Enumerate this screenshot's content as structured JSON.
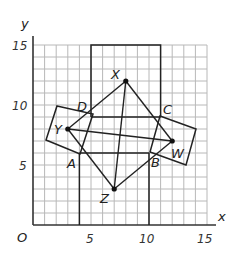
{
  "diagram": {
    "axes": {
      "x_label": "x",
      "y_label": "y",
      "origin_label": "O",
      "x_ticks": [
        {
          "value": 5,
          "label": "5"
        },
        {
          "value": 10,
          "label": "10"
        },
        {
          "value": 15,
          "label": "15"
        }
      ],
      "y_ticks": [
        {
          "value": 5,
          "label": "5"
        },
        {
          "value": 10,
          "label": "10"
        },
        {
          "value": 15,
          "label": "15"
        }
      ],
      "x_range": [
        0,
        15
      ],
      "y_range": [
        0,
        15
      ]
    },
    "points": {
      "X": {
        "label": "X",
        "x": 8,
        "y": 12
      },
      "Y": {
        "label": "Y",
        "x": 3,
        "y": 8
      },
      "Z": {
        "label": "Z",
        "x": 7,
        "y": 3
      },
      "W": {
        "label": "W",
        "x": 12,
        "y": 7
      }
    },
    "vertices": {
      "A": {
        "label": "A",
        "x": 4,
        "y": 6
      },
      "B": {
        "label": "B",
        "x": 10,
        "y": 6
      },
      "C": {
        "label": "C",
        "x": 11,
        "y": 9
      },
      "D": {
        "label": "D",
        "x": 5,
        "y": 9
      }
    },
    "colors": {
      "grid": "#b8b8b8",
      "lines": "#222222",
      "background": "#ffffff"
    }
  }
}
